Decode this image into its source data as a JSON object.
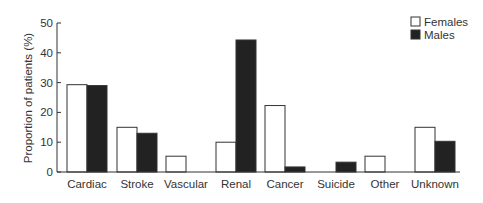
{
  "chart_data": {
    "type": "bar",
    "title": "",
    "xlabel": "",
    "ylabel": "Proportion of patients (%)",
    "ylim": [
      0,
      50
    ],
    "yticks": [
      0,
      10,
      20,
      30,
      40,
      50
    ],
    "grid": false,
    "legend_position": "top-right",
    "categories": [
      "Cardiac",
      "Stroke",
      "Vascular",
      "Renal",
      "Cancer",
      "Suicide",
      "Other",
      "Unknown"
    ],
    "series": [
      {
        "name": "Females",
        "color": "#ffffff",
        "values": [
          29.3,
          15,
          5.3,
          10,
          22.3,
          0,
          5.3,
          15
        ]
      },
      {
        "name": "Males",
        "color": "#222222",
        "values": [
          29,
          13,
          0,
          44.3,
          1.7,
          3.3,
          0,
          10.3
        ]
      }
    ]
  }
}
